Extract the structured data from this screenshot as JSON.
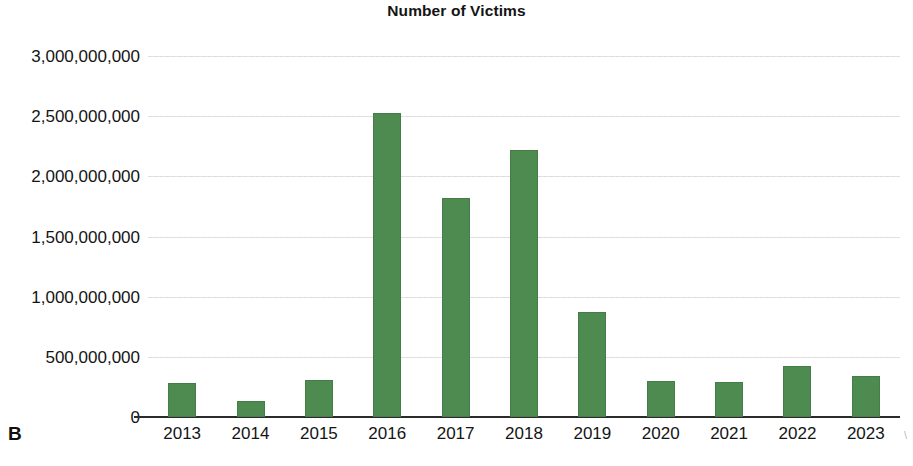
{
  "panel": {
    "label": "B"
  },
  "chart_data": {
    "type": "bar",
    "title": "Number of Victims",
    "xlabel": "",
    "ylabel": "",
    "categories": [
      "2013",
      "2014",
      "2015",
      "2016",
      "2017",
      "2018",
      "2019",
      "2020",
      "2021",
      "2022",
      "2023"
    ],
    "values": [
      280000000,
      135000000,
      310000000,
      2530000000,
      1820000000,
      2220000000,
      870000000,
      300000000,
      290000000,
      420000000,
      340000000
    ],
    "ylim": [
      0,
      3000000000
    ],
    "ytick_values": [
      0,
      500000000,
      1000000000,
      1500000000,
      2000000000,
      2500000000,
      3000000000
    ],
    "ytick_labels": [
      "0",
      "500,000,000",
      "1,000,000,000",
      "1,500,000,000",
      "2,000,000,000",
      "2,500,000,000",
      "3,000,000,000"
    ],
    "grid": true,
    "legend": false,
    "bar_color": "#4e8b50",
    "grid_color": "#dcdcdc",
    "axis_color": "#2b2b2b"
  },
  "artifacts": {
    "right_edge_mark": "\\"
  }
}
